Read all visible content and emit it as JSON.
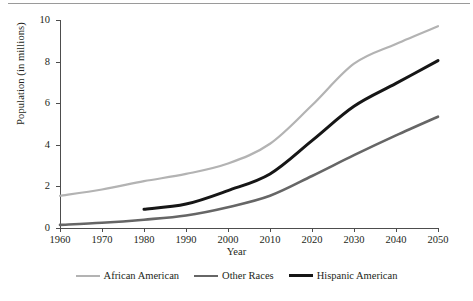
{
  "chart_data": {
    "type": "line",
    "title": "",
    "xlabel": "Year",
    "ylabel": "Population (in millions)",
    "x": [
      1960,
      1970,
      1980,
      1990,
      2000,
      2010,
      2020,
      2030,
      2040,
      2050
    ],
    "xticklabels": [
      "1960",
      "1970",
      "1980",
      "1990",
      "2000",
      "2010",
      "2020",
      "2030",
      "2040",
      "2050"
    ],
    "yticklabels": [
      "0",
      "2",
      "4",
      "6",
      "8",
      "10"
    ],
    "yticks": [
      0,
      2,
      4,
      6,
      8,
      10
    ],
    "xlim": [
      1960,
      2050
    ],
    "ylim": [
      0,
      10
    ],
    "grid": false,
    "legend_position": "below",
    "series": [
      {
        "name": "African American",
        "color": "#b3b3b3",
        "x": [
          1960,
          1970,
          1980,
          1990,
          2000,
          2010,
          2020,
          2030,
          2040,
          2050
        ],
        "values": [
          1.55,
          1.85,
          2.25,
          2.6,
          3.1,
          4.05,
          5.9,
          7.9,
          8.85,
          9.7
        ]
      },
      {
        "name": "Other Races",
        "color": "#666666",
        "x": [
          1960,
          1970,
          1980,
          1990,
          2000,
          2010,
          2020,
          2030,
          2040,
          2050
        ],
        "values": [
          0.15,
          0.25,
          0.4,
          0.6,
          1.0,
          1.55,
          2.5,
          3.5,
          4.45,
          5.35
        ]
      },
      {
        "name": "Hispanic American",
        "color": "#161616",
        "x": [
          1980,
          1990,
          2000,
          2010,
          2020,
          2030,
          2040,
          2050
        ],
        "values": [
          0.9,
          1.15,
          1.8,
          2.6,
          4.2,
          5.85,
          6.95,
          8.05
        ]
      }
    ]
  },
  "legend": {
    "items": [
      {
        "label": "African American",
        "color": "#b3b3b3",
        "thickness": "2.2px"
      },
      {
        "label": "Other Races",
        "color": "#666666",
        "thickness": "2.6px"
      },
      {
        "label": "Hispanic American",
        "color": "#161616",
        "thickness": "3.0px"
      }
    ]
  },
  "axes": {
    "axis_color": "#4d4d4d",
    "ylabel": "Population (in millions)",
    "xlabel": "Year"
  }
}
